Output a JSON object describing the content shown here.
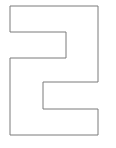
{
  "figure": {
    "glyph": "2",
    "stroke_color": "#7a7a7a",
    "fill_color": "#ffffff",
    "points": "10,6 98,6 98,82 43,82 43,109 98,109 98,135 10,135 10,58 66,58 66,32 10,32"
  }
}
